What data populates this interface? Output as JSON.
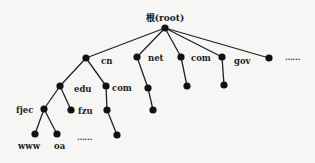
{
  "root": {
    "label": "根(root)",
    "x": 165,
    "y": 28
  },
  "nodes": [
    {
      "id": "cn",
      "label": "cn",
      "x": 86,
      "y": 58,
      "parent": "root",
      "lx": 101,
      "ly": 64
    },
    {
      "id": "net",
      "label": "net",
      "x": 137,
      "y": 57,
      "parent": "root",
      "lx": 148,
      "ly": 61
    },
    {
      "id": "com-top",
      "label": "com",
      "x": 181,
      "y": 57,
      "parent": "root",
      "lx": 191,
      "ly": 61
    },
    {
      "id": "gov",
      "label": "gov",
      "x": 222,
      "y": 57,
      "parent": "root",
      "lx": 234,
      "ly": 64
    },
    {
      "id": "more-top",
      "label": "",
      "x": 269,
      "y": 58,
      "parent": "root"
    },
    {
      "id": "edu",
      "label": "edu",
      "x": 60,
      "y": 86,
      "parent": "cn",
      "lx": 74,
      "ly": 92
    },
    {
      "id": "com-cn",
      "label": "com",
      "x": 106,
      "y": 86,
      "parent": "cn",
      "lx": 112,
      "ly": 91
    },
    {
      "id": "net-c1",
      "label": "",
      "x": 148,
      "y": 88,
      "parent": "net"
    },
    {
      "id": "com-c1",
      "label": "",
      "x": 187,
      "y": 86,
      "parent": "com-top"
    },
    {
      "id": "gov-c1",
      "label": "",
      "x": 224,
      "y": 85,
      "parent": "gov"
    },
    {
      "id": "fjec",
      "label": "fjec",
      "x": 44,
      "y": 109,
      "parent": "edu",
      "lx": 16,
      "ly": 113
    },
    {
      "id": "fzu",
      "label": "fzu",
      "x": 71,
      "y": 110,
      "parent": "edu",
      "lx": 78,
      "ly": 114
    },
    {
      "id": "com-cn-c1",
      "label": "",
      "x": 107,
      "y": 110,
      "parent": "com-cn"
    },
    {
      "id": "net-c2",
      "label": "",
      "x": 153,
      "y": 110,
      "parent": "net-c1"
    },
    {
      "id": "www",
      "label": "www",
      "x": 35,
      "y": 134,
      "parent": "fjec",
      "lx": 18,
      "ly": 149
    },
    {
      "id": "oa",
      "label": "oa",
      "x": 57,
      "y": 134,
      "parent": "fjec",
      "lx": 54,
      "ly": 149
    },
    {
      "id": "com-cn-c2",
      "label": "",
      "x": 117,
      "y": 135,
      "parent": "com-cn-c1"
    }
  ],
  "ellipses": [
    {
      "text": "……",
      "x": 285,
      "y": 60
    },
    {
      "text": "……",
      "x": 77,
      "y": 140
    }
  ]
}
